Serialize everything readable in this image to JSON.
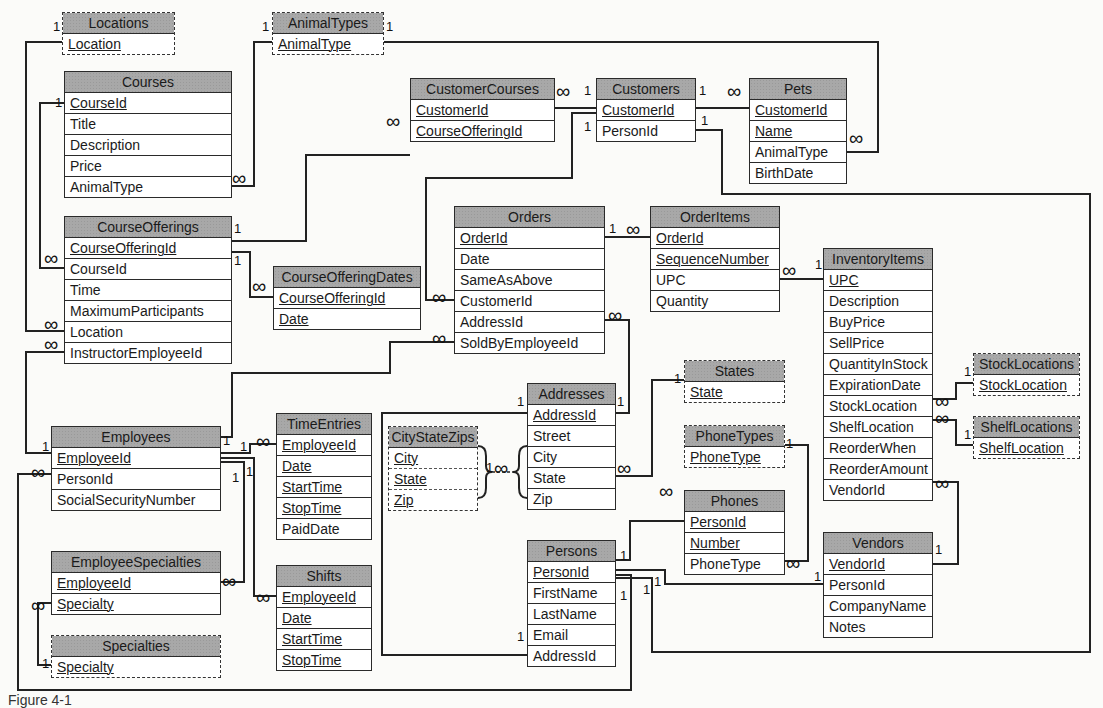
{
  "diagram": {
    "type": "entity-relationship",
    "caption": "Figure 4-1"
  },
  "tables": [
    {
      "id": "Locations",
      "title": "Locations",
      "lookup": true,
      "x": 62,
      "y": 12,
      "w": 113,
      "fields": [
        {
          "name": "Location",
          "key": true
        }
      ]
    },
    {
      "id": "AnimalTypes",
      "title": "AnimalTypes",
      "lookup": true,
      "x": 272,
      "y": 12,
      "w": 112,
      "fields": [
        {
          "name": "AnimalType",
          "key": true
        }
      ]
    },
    {
      "id": "Courses",
      "title": "Courses",
      "lookup": false,
      "x": 64,
      "y": 71,
      "w": 168,
      "fields": [
        {
          "name": "CourseId",
          "key": true
        },
        {
          "name": "Title",
          "key": false
        },
        {
          "name": "Description",
          "key": false
        },
        {
          "name": "Price",
          "key": false
        },
        {
          "name": "AnimalType",
          "key": false
        }
      ]
    },
    {
      "id": "CustomerCourses",
      "title": "CustomerCourses",
      "lookup": false,
      "x": 410,
      "y": 78,
      "w": 145,
      "fields": [
        {
          "name": "CustomerId",
          "key": true
        },
        {
          "name": "CourseOfferingId",
          "key": true
        }
      ]
    },
    {
      "id": "Customers",
      "title": "Customers",
      "lookup": false,
      "x": 596,
      "y": 78,
      "w": 100,
      "fields": [
        {
          "name": "CustomerId",
          "key": true
        },
        {
          "name": "PersonId",
          "key": false
        }
      ]
    },
    {
      "id": "Pets",
      "title": "Pets",
      "lookup": false,
      "x": 749,
      "y": 78,
      "w": 98,
      "fields": [
        {
          "name": "CustomerId",
          "key": true
        },
        {
          "name": "Name",
          "key": true
        },
        {
          "name": "AnimalType",
          "key": false
        },
        {
          "name": "BirthDate",
          "key": false
        }
      ]
    },
    {
      "id": "CourseOfferings",
      "title": "CourseOfferings",
      "lookup": false,
      "x": 64,
      "y": 216,
      "w": 168,
      "fields": [
        {
          "name": "CourseOfferingId",
          "key": true
        },
        {
          "name": "CourseId",
          "key": false
        },
        {
          "name": "Time",
          "key": false
        },
        {
          "name": "MaximumParticipants",
          "key": false
        },
        {
          "name": "Location",
          "key": false
        },
        {
          "name": "InstructorEmployeeId",
          "key": false
        }
      ]
    },
    {
      "id": "CourseOfferingDates",
      "title": "CourseOfferingDates",
      "lookup": false,
      "x": 273,
      "y": 266,
      "w": 148,
      "fields": [
        {
          "name": "CourseOfferingId",
          "key": true
        },
        {
          "name": "Date",
          "key": true
        }
      ]
    },
    {
      "id": "Orders",
      "title": "Orders",
      "lookup": false,
      "x": 454,
      "y": 206,
      "w": 151,
      "fields": [
        {
          "name": "OrderId",
          "key": true
        },
        {
          "name": "Date",
          "key": false
        },
        {
          "name": "SameAsAbove",
          "key": false
        },
        {
          "name": "CustomerId",
          "key": false
        },
        {
          "name": "AddressId",
          "key": false
        },
        {
          "name": "SoldByEmployeeId",
          "key": false
        }
      ]
    },
    {
      "id": "OrderItems",
      "title": "OrderItems",
      "lookup": false,
      "x": 650,
      "y": 206,
      "w": 130,
      "fields": [
        {
          "name": "OrderId",
          "key": true
        },
        {
          "name": "SequenceNumber",
          "key": true
        },
        {
          "name": "UPC",
          "key": false
        },
        {
          "name": "Quantity",
          "key": false
        }
      ]
    },
    {
      "id": "InventoryItems",
      "title": "InventoryItems",
      "lookup": false,
      "x": 823,
      "y": 248,
      "w": 110,
      "fields": [
        {
          "name": "UPC",
          "key": true
        },
        {
          "name": "Description",
          "key": false
        },
        {
          "name": "BuyPrice",
          "key": false
        },
        {
          "name": "SellPrice",
          "key": false
        },
        {
          "name": "QuantityInStock",
          "key": false
        },
        {
          "name": "ExpirationDate",
          "key": false
        },
        {
          "name": "StockLocation",
          "key": false
        },
        {
          "name": "ShelfLocation",
          "key": false
        },
        {
          "name": "ReorderWhen",
          "key": false
        },
        {
          "name": "ReorderAmount",
          "key": false
        },
        {
          "name": "VendorId",
          "key": false
        }
      ]
    },
    {
      "id": "StockLocations",
      "title": "StockLocations",
      "lookup": true,
      "x": 973,
      "y": 353,
      "w": 107,
      "fields": [
        {
          "name": "StockLocation",
          "key": true
        }
      ]
    },
    {
      "id": "ShelfLocations",
      "title": "ShelfLocations",
      "lookup": true,
      "x": 973,
      "y": 416,
      "w": 107,
      "fields": [
        {
          "name": "ShelfLocation",
          "key": true
        }
      ]
    },
    {
      "id": "States",
      "title": "States",
      "lookup": true,
      "x": 684,
      "y": 360,
      "w": 101,
      "fields": [
        {
          "name": "State",
          "key": true
        }
      ]
    },
    {
      "id": "PhoneTypes",
      "title": "PhoneTypes",
      "lookup": true,
      "x": 684,
      "y": 425,
      "w": 101,
      "fields": [
        {
          "name": "PhoneType",
          "key": true
        }
      ]
    },
    {
      "id": "Addresses",
      "title": "Addresses",
      "lookup": false,
      "x": 527,
      "y": 383,
      "w": 89,
      "fields": [
        {
          "name": "AddressId",
          "key": true
        },
        {
          "name": "Street",
          "key": false
        },
        {
          "name": "City",
          "key": false
        },
        {
          "name": "State",
          "key": false
        },
        {
          "name": "Zip",
          "key": false
        }
      ]
    },
    {
      "id": "CityStateZips",
      "title": "CityStateZips",
      "lookup": true,
      "x": 388,
      "y": 426,
      "w": 90,
      "fields": [
        {
          "name": "City",
          "key": true
        },
        {
          "name": "State",
          "key": true
        },
        {
          "name": "Zip",
          "key": true
        }
      ]
    },
    {
      "id": "Employees",
      "title": "Employees",
      "lookup": false,
      "x": 51,
      "y": 426,
      "w": 170,
      "fields": [
        {
          "name": "EmployeeId",
          "key": true
        },
        {
          "name": "PersonId",
          "key": false
        },
        {
          "name": "SocialSecurityNumber",
          "key": false
        }
      ]
    },
    {
      "id": "TimeEntries",
      "title": "TimeEntries",
      "lookup": false,
      "x": 276,
      "y": 413,
      "w": 96,
      "fields": [
        {
          "name": "EmployeeId",
          "key": true
        },
        {
          "name": "Date",
          "key": true
        },
        {
          "name": "StartTime",
          "key": true
        },
        {
          "name": "StopTime",
          "key": true
        },
        {
          "name": "PaidDate",
          "key": false
        }
      ]
    },
    {
      "id": "Phones",
      "title": "Phones",
      "lookup": false,
      "x": 684,
      "y": 490,
      "w": 101,
      "fields": [
        {
          "name": "PersonId",
          "key": true
        },
        {
          "name": "Number",
          "key": true
        },
        {
          "name": "PhoneType",
          "key": false
        }
      ]
    },
    {
      "id": "Persons",
      "title": "Persons",
      "lookup": false,
      "x": 527,
      "y": 540,
      "w": 89,
      "fields": [
        {
          "name": "PersonId",
          "key": true
        },
        {
          "name": "FirstName",
          "key": false
        },
        {
          "name": "LastName",
          "key": false
        },
        {
          "name": "Email",
          "key": false
        },
        {
          "name": "AddressId",
          "key": false
        }
      ]
    },
    {
      "id": "Vendors",
      "title": "Vendors",
      "lookup": false,
      "x": 823,
      "y": 532,
      "w": 110,
      "fields": [
        {
          "name": "VendorId",
          "key": true
        },
        {
          "name": "PersonId",
          "key": false
        },
        {
          "name": "CompanyName",
          "key": false
        },
        {
          "name": "Notes",
          "key": false
        }
      ]
    },
    {
      "id": "EmployeeSpecialties",
      "title": "EmployeeSpecialties",
      "lookup": false,
      "x": 51,
      "y": 551,
      "w": 170,
      "fields": [
        {
          "name": "EmployeeId",
          "key": true
        },
        {
          "name": "Specialty",
          "key": true
        }
      ]
    },
    {
      "id": "Shifts",
      "title": "Shifts",
      "lookup": false,
      "x": 276,
      "y": 565,
      "w": 96,
      "fields": [
        {
          "name": "EmployeeId",
          "key": true
        },
        {
          "name": "Date",
          "key": true
        },
        {
          "name": "StartTime",
          "key": true
        },
        {
          "name": "StopTime",
          "key": true
        }
      ]
    },
    {
      "id": "Specialties",
      "title": "Specialties",
      "lookup": true,
      "x": 51,
      "y": 635,
      "w": 170,
      "fields": [
        {
          "name": "Specialty",
          "key": true
        }
      ]
    }
  ],
  "relationships": [
    {
      "from": "Locations.Location",
      "to": "CourseOfferings.Location",
      "from_card": "1",
      "to_card": "∞"
    },
    {
      "from": "AnimalTypes.AnimalType",
      "to": "Courses.AnimalType",
      "from_card": "1",
      "to_card": "∞"
    },
    {
      "from": "AnimalTypes.AnimalType",
      "to": "Pets.AnimalType",
      "from_card": "1",
      "to_card": "∞"
    },
    {
      "from": "Courses.CourseId",
      "to": "CourseOfferings.CourseId",
      "from_card": "1",
      "to_card": "∞"
    },
    {
      "from": "CourseOfferings.CourseOfferingId",
      "to": "CustomerCourses.CourseOfferingId",
      "from_card": "1",
      "to_card": "∞"
    },
    {
      "from": "CourseOfferings.CourseOfferingId",
      "to": "CourseOfferingDates.CourseOfferingId",
      "from_card": "1",
      "to_card": "∞"
    },
    {
      "from": "Customers.CustomerId",
      "to": "CustomerCourses.CustomerId",
      "from_card": "1",
      "to_card": "∞"
    },
    {
      "from": "Customers.CustomerId",
      "to": "Pets.CustomerId",
      "from_card": "1",
      "to_card": "∞"
    },
    {
      "from": "Customers.CustomerId",
      "to": "Orders.CustomerId",
      "from_card": "1",
      "to_card": "∞"
    },
    {
      "from": "Customers.PersonId",
      "to": "Persons.PersonId",
      "from_card": "1",
      "to_card": "1"
    },
    {
      "from": "Orders.OrderId",
      "to": "OrderItems.OrderId",
      "from_card": "1",
      "to_card": "∞"
    },
    {
      "from": "InventoryItems.UPC",
      "to": "OrderItems.UPC",
      "from_card": "1",
      "to_card": "∞"
    },
    {
      "from": "Addresses.AddressId",
      "to": "Orders.AddressId",
      "from_card": "1",
      "to_card": "∞"
    },
    {
      "from": "Employees.EmployeeId",
      "to": "Orders.SoldByEmployeeId",
      "from_card": "1",
      "to_card": "∞"
    },
    {
      "from": "Employees.EmployeeId",
      "to": "CourseOfferings.InstructorEmployeeId",
      "from_card": "1",
      "to_card": "∞"
    },
    {
      "from": "StockLocations.StockLocation",
      "to": "InventoryItems.StockLocation",
      "from_card": "1",
      "to_card": "∞"
    },
    {
      "from": "ShelfLocations.ShelfLocation",
      "to": "InventoryItems.ShelfLocation",
      "from_card": "1",
      "to_card": "∞"
    },
    {
      "from": "Vendors.VendorId",
      "to": "InventoryItems.VendorId",
      "from_card": "1",
      "to_card": "∞"
    },
    {
      "from": "States.State",
      "to": "Addresses.State",
      "from_card": "1",
      "to_card": "∞"
    },
    {
      "from": "CityStateZips.(City,State,Zip)",
      "to": "Addresses.(City,State,Zip)",
      "from_card": "1",
      "to_card": "∞"
    },
    {
      "from": "Addresses.AddressId",
      "to": "Persons.AddressId",
      "from_card": "1",
      "to_card": "1"
    },
    {
      "from": "PhoneTypes.PhoneType",
      "to": "Phones.PhoneType",
      "from_card": "1",
      "to_card": "∞"
    },
    {
      "from": "Persons.PersonId",
      "to": "Phones.PersonId",
      "from_card": "1",
      "to_card": "∞"
    },
    {
      "from": "Persons.PersonId",
      "to": "Vendors.PersonId",
      "from_card": "1",
      "to_card": "1"
    },
    {
      "from": "Persons.PersonId",
      "to": "Employees.PersonId",
      "from_card": "1",
      "to_card": "∞"
    },
    {
      "from": "Employees.EmployeeId",
      "to": "TimeEntries.EmployeeId",
      "from_card": "1",
      "to_card": "∞"
    },
    {
      "from": "Employees.EmployeeId",
      "to": "Shifts.EmployeeId",
      "from_card": "1",
      "to_card": "∞"
    },
    {
      "from": "Employees.EmployeeId",
      "to": "EmployeeSpecialties.EmployeeId",
      "from_card": "1",
      "to_card": "∞"
    },
    {
      "from": "Specialties.Specialty",
      "to": "EmployeeSpecialties.Specialty",
      "from_card": "1",
      "to_card": "∞"
    }
  ],
  "labels": [
    {
      "t": "1",
      "x": 53,
      "y": 20
    },
    {
      "t": "1",
      "x": 262,
      "y": 20
    },
    {
      "t": "1",
      "x": 386,
      "y": 20
    },
    {
      "t": "1",
      "x": 55,
      "y": 96
    },
    {
      "t": "∞",
      "x": 232,
      "y": 171,
      "inf": true
    },
    {
      "t": "∞",
      "x": 386,
      "y": 114,
      "inf": true
    },
    {
      "t": "1",
      "x": 584,
      "y": 84
    },
    {
      "t": "∞",
      "x": 556,
      "y": 84,
      "inf": true
    },
    {
      "t": "1",
      "x": 699,
      "y": 84
    },
    {
      "t": "∞",
      "x": 727,
      "y": 84,
      "inf": true
    },
    {
      "t": "1",
      "x": 584,
      "y": 120
    },
    {
      "t": "1",
      "x": 701,
      "y": 114
    },
    {
      "t": "∞",
      "x": 849,
      "y": 131,
      "inf": true
    },
    {
      "t": "1",
      "x": 234,
      "y": 222
    },
    {
      "t": "1",
      "x": 234,
      "y": 254
    },
    {
      "t": "∞",
      "x": 252,
      "y": 279,
      "inf": true
    },
    {
      "t": "∞",
      "x": 44,
      "y": 251,
      "inf": true
    },
    {
      "t": "∞",
      "x": 44,
      "y": 317,
      "inf": true
    },
    {
      "t": "∞",
      "x": 44,
      "y": 337,
      "inf": true
    },
    {
      "t": "1",
      "x": 609,
      "y": 222
    },
    {
      "t": "∞",
      "x": 626,
      "y": 222,
      "inf": true
    },
    {
      "t": "∞",
      "x": 432,
      "y": 290,
      "inf": true
    },
    {
      "t": "∞",
      "x": 608,
      "y": 308,
      "inf": true
    },
    {
      "t": "∞",
      "x": 432,
      "y": 331,
      "inf": true
    },
    {
      "t": "∞",
      "x": 782,
      "y": 263,
      "inf": true
    },
    {
      "t": "1",
      "x": 815,
      "y": 258
    },
    {
      "t": "1",
      "x": 964,
      "y": 365
    },
    {
      "t": "∞",
      "x": 935,
      "y": 394,
      "inf": true
    },
    {
      "t": "∞",
      "x": 935,
      "y": 411,
      "inf": true
    },
    {
      "t": "1",
      "x": 964,
      "y": 428
    },
    {
      "t": "∞",
      "x": 935,
      "y": 476,
      "inf": true
    },
    {
      "t": "1",
      "x": 674,
      "y": 372
    },
    {
      "t": "∞",
      "x": 617,
      "y": 461,
      "inf": true
    },
    {
      "t": "1",
      "x": 517,
      "y": 395
    },
    {
      "t": "1",
      "x": 617,
      "y": 395
    },
    {
      "t": "1",
      "x": 486,
      "y": 461
    },
    {
      "t": "∞",
      "x": 494,
      "y": 461,
      "inf": true
    },
    {
      "t": "1",
      "x": 786,
      "y": 437
    },
    {
      "t": "∞",
      "x": 659,
      "y": 484,
      "inf": true
    },
    {
      "t": "∞",
      "x": 786,
      "y": 556,
      "inf": true
    },
    {
      "t": "1",
      "x": 620,
      "y": 549
    },
    {
      "t": "1",
      "x": 620,
      "y": 589
    },
    {
      "t": "1",
      "x": 643,
      "y": 583
    },
    {
      "t": "1",
      "x": 654,
      "y": 575
    },
    {
      "t": "1",
      "x": 814,
      "y": 570
    },
    {
      "t": "1",
      "x": 935,
      "y": 543
    },
    {
      "t": "1",
      "x": 517,
      "y": 630
    },
    {
      "t": "1",
      "x": 42,
      "y": 440
    },
    {
      "t": "∞",
      "x": 31,
      "y": 465,
      "inf": true
    },
    {
      "t": "1",
      "x": 223,
      "y": 434
    },
    {
      "t": "1",
      "x": 240,
      "y": 440
    },
    {
      "t": "∞",
      "x": 256,
      "y": 434,
      "inf": true
    },
    {
      "t": "1",
      "x": 232,
      "y": 471
    },
    {
      "t": "1",
      "x": 246,
      "y": 465
    },
    {
      "t": "∞",
      "x": 222,
      "y": 574,
      "inf": true
    },
    {
      "t": "∞",
      "x": 256,
      "y": 590,
      "inf": true
    },
    {
      "t": "∞",
      "x": 31,
      "y": 598,
      "inf": true
    },
    {
      "t": "1",
      "x": 42,
      "y": 657
    }
  ]
}
